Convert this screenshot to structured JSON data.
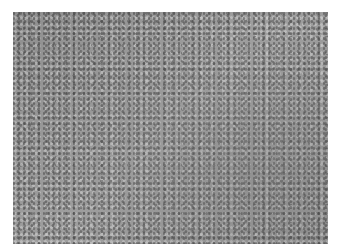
{
  "image": {
    "kind": "grayscale histology micrograph",
    "alt": "Grayscale photomicrograph of densely cellular tissue"
  }
}
